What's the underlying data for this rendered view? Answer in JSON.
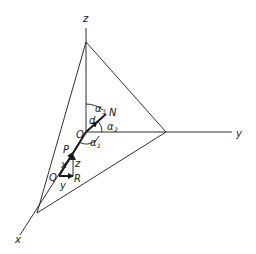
{
  "figure": {
    "type": "3d-coordinate-diagram",
    "axes": {
      "x": "x",
      "y": "y",
      "z": "z"
    },
    "points": {
      "origin": "O",
      "normal_end": "N",
      "P": "P",
      "Q": "Q",
      "R": "R"
    },
    "distance_label": "d",
    "angles": {
      "alpha1": {
        "symbol": "α",
        "sub": "1"
      },
      "alpha2": {
        "symbol": "α",
        "sub": "2"
      },
      "alpha3": {
        "symbol": "α",
        "sub": "3"
      }
    },
    "component_labels": {
      "x": "x",
      "y": "y",
      "z": "z"
    },
    "colors": {
      "ink": "#1a1a1a",
      "background": "#ffffff"
    }
  }
}
